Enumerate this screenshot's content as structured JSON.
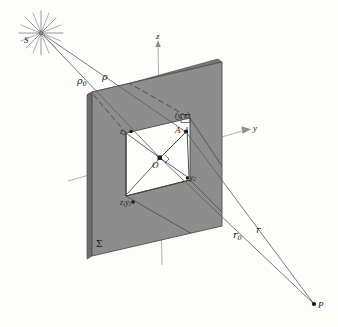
{
  "figure": {
    "kind": "optics-diffraction-diagram",
    "colors": {
      "background": "#fdfdfc",
      "screen_face": "#8a8a8a",
      "screen_edge": "#5f5f5f",
      "aperture": "#ffffff",
      "line": "#4a4a4a",
      "axis": "#9a9a9a",
      "label": "#1a1a1a",
      "star": "#777777"
    }
  },
  "labels": {
    "source": "S",
    "observation_point": "P",
    "origin": "O",
    "aperture_point": "A",
    "aperture_point_coords_open": "(",
    "aperture_point_coords": "y, z",
    "aperture_point_coords_close": ")",
    "screen": "Σ",
    "axis_z": "z",
    "axis_y": "y",
    "rho_zero_base": "ρ",
    "rho_zero_sub": "0",
    "rho": "ρ",
    "r_zero_base": "r",
    "r_zero_sub": "0",
    "r": "r",
    "corner_z1_base": "z",
    "corner_z1_sub": "1",
    "corner_y1_base": "y",
    "corner_y1_sub": "1",
    "corner_z2_base": "z",
    "corner_z2_sub": "2",
    "corner_y2_base": "y",
    "corner_y2_sub": "2"
  },
  "geometry": {
    "source_point": {
      "x": 41,
      "y": 33
    },
    "observation_point": {
      "x": 314,
      "y": 304
    },
    "origin_point": {
      "x": 160,
      "y": 158
    },
    "aperture_point_A": {
      "x": 186,
      "y": 132
    },
    "screen_corners": [
      {
        "x": 92,
        "y": 92
      },
      {
        "x": 222,
        "y": 62
      },
      {
        "x": 222,
        "y": 226
      },
      {
        "x": 92,
        "y": 256
      }
    ],
    "aperture_corners": [
      {
        "x": 126,
        "y": 133
      },
      {
        "x": 190,
        "y": 118
      },
      {
        "x": 190,
        "y": 180
      },
      {
        "x": 126,
        "y": 196
      }
    ]
  }
}
